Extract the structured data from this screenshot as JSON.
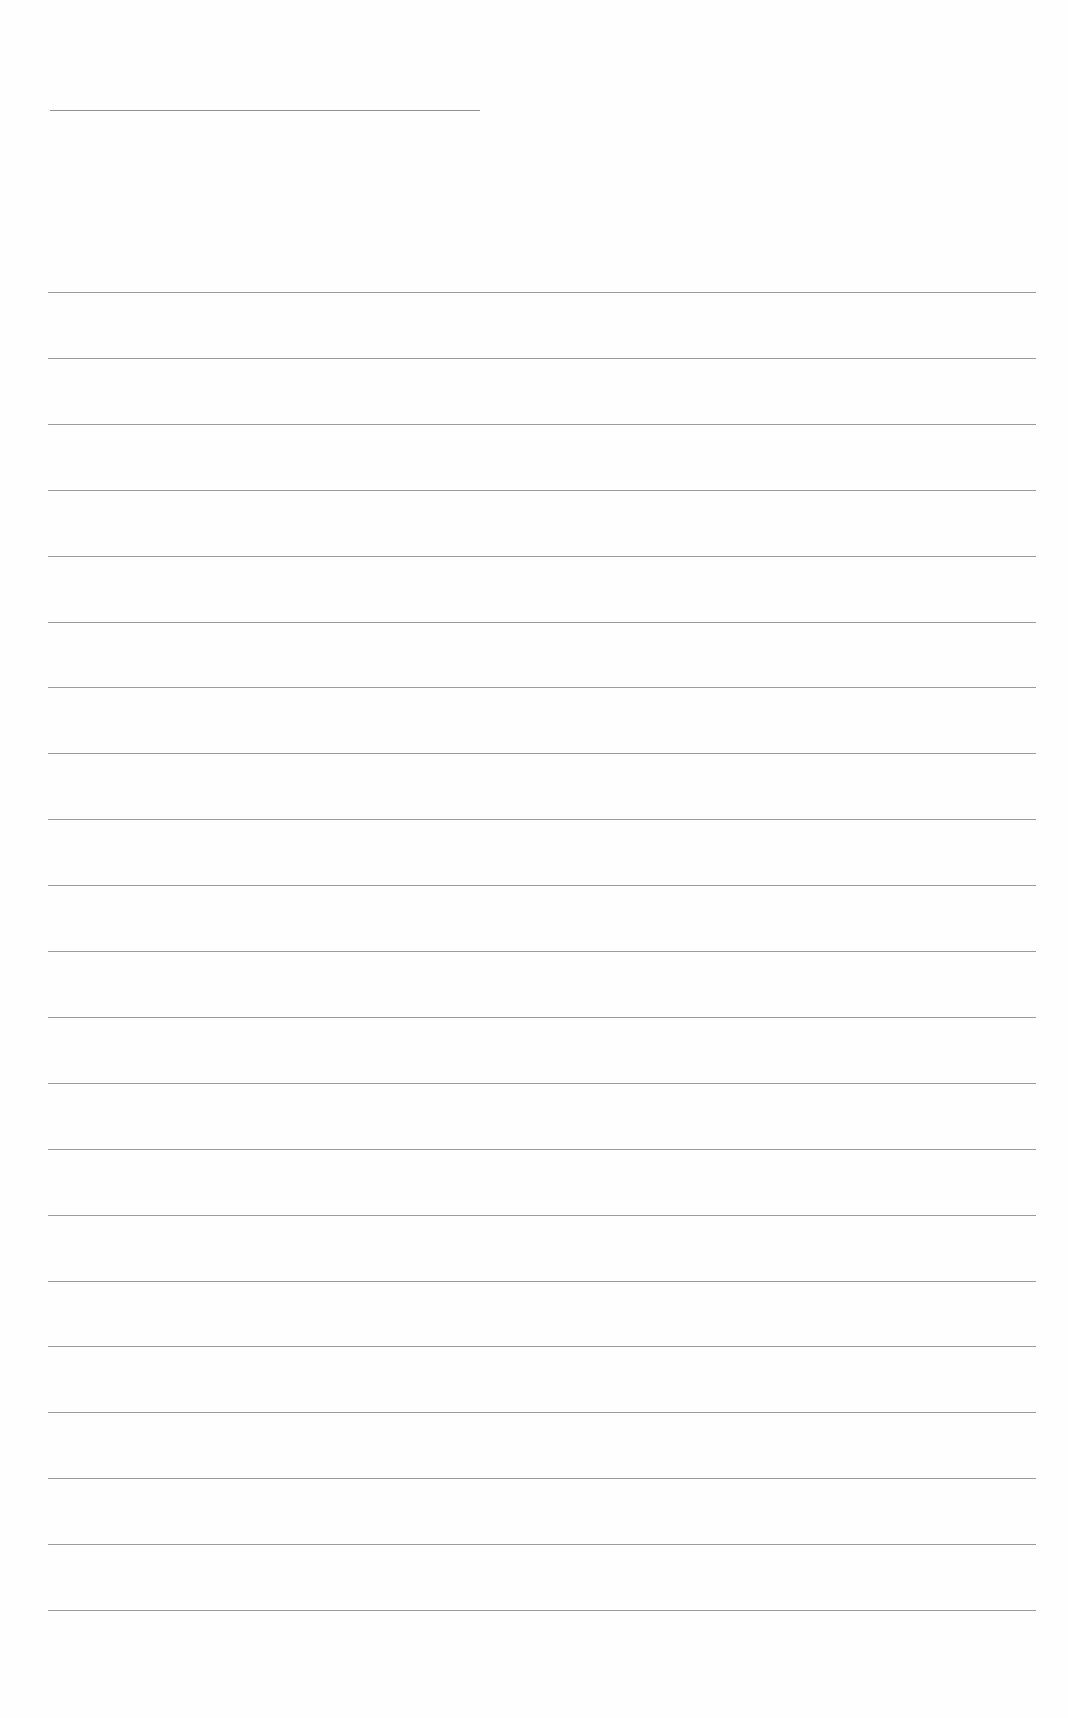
{
  "document": {
    "type": "blank lined sheet",
    "background_color": "#fefefe",
    "line_color": "#8a8a8a",
    "title_line": {
      "x1": 50,
      "x2": 480,
      "y": 110
    },
    "writing_lines": {
      "count": 21,
      "x1": 48,
      "x2": 1036,
      "first_y": 292,
      "spacing": 65.9
    }
  }
}
